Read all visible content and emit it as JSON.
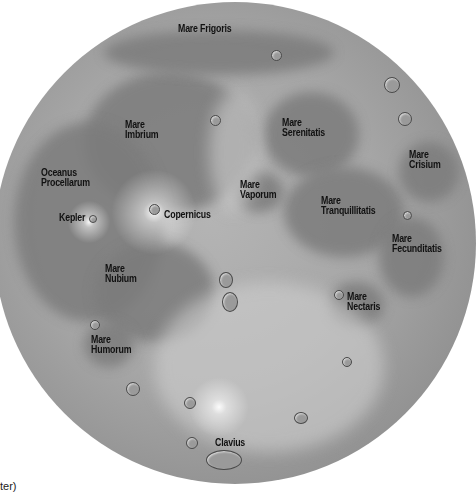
{
  "map": {
    "subject": "Moon (near side)",
    "colors": {
      "background": "#ffffff",
      "highlands": "#b4b4b4",
      "maria": "#7c7c7c",
      "label": "#111111"
    },
    "labels": [
      {
        "id": "mare-frigoris",
        "lines": [
          "Mare Frigoris"
        ],
        "x": 178,
        "y": 24
      },
      {
        "id": "mare-imbrium",
        "lines": [
          "Mare",
          "Imbrium"
        ],
        "x": 125,
        "y": 120
      },
      {
        "id": "oceanus-procellarum",
        "lines": [
          "Oceanus",
          "Procellarum"
        ],
        "x": 41,
        "y": 168
      },
      {
        "id": "kepler",
        "lines": [
          "Kepler"
        ],
        "x": 59,
        "y": 213
      },
      {
        "id": "copernicus",
        "lines": [
          "Copernicus"
        ],
        "x": 164,
        "y": 210
      },
      {
        "id": "mare-nubium",
        "lines": [
          "Mare",
          "Nubium"
        ],
        "x": 105,
        "y": 264
      },
      {
        "id": "mare-humorum",
        "lines": [
          "Mare",
          "Humorum"
        ],
        "x": 91,
        "y": 335
      },
      {
        "id": "mare-serenitatis",
        "lines": [
          "Mare",
          "Serenitatis"
        ],
        "x": 282,
        "y": 118
      },
      {
        "id": "mare-vaporum",
        "lines": [
          "Mare",
          "Vaporum"
        ],
        "x": 240,
        "y": 180
      },
      {
        "id": "mare-tranquillitatis",
        "lines": [
          "Mare",
          "Tranquillitatis"
        ],
        "x": 321,
        "y": 196
      },
      {
        "id": "mare-crisium",
        "lines": [
          "Mare",
          "Crisium"
        ],
        "x": 409,
        "y": 150
      },
      {
        "id": "mare-fecunditatis",
        "lines": [
          "Mare",
          "Fecunditatis"
        ],
        "x": 392,
        "y": 234
      },
      {
        "id": "mare-nectaris",
        "lines": [
          "Mare",
          "Nectaris"
        ],
        "x": 347,
        "y": 292
      },
      {
        "id": "clavius",
        "lines": [
          "Clavius"
        ],
        "x": 215,
        "y": 438
      }
    ],
    "caption_fragment": "ter)"
  }
}
